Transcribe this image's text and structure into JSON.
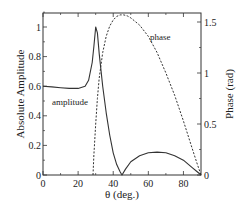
{
  "chart_data": {
    "type": "line",
    "title": "",
    "xlabel": "θ (deg.)",
    "ylabel": "Absolute Amplitude",
    "y2label": "Phase (rad)",
    "xlim": [
      0,
      90
    ],
    "ylim": [
      0,
      1.1
    ],
    "y2lim": [
      0,
      1.6
    ],
    "grid": false,
    "x_ticks": [
      0,
      20,
      40,
      60,
      80
    ],
    "y_ticks": [
      0,
      0.2,
      0.4,
      0.6,
      0.8,
      1
    ],
    "y2_ticks": [
      0,
      0.5,
      1,
      1.5
    ],
    "x_tick_labels": [
      "0",
      "20",
      "40",
      "60",
      "80"
    ],
    "y_tick_labels": [
      "0",
      "0.2",
      "0.4",
      "0.6",
      "0.8",
      "1"
    ],
    "y2_tick_labels": [
      "0",
      "0.5",
      "1",
      "1.5"
    ],
    "series": [
      {
        "name": "amplitude",
        "axis": "left",
        "style": "solid",
        "x": [
          0,
          5,
          10,
          15,
          20,
          24,
          26,
          28,
          29,
          30,
          31,
          32,
          34,
          36,
          38,
          40,
          42,
          44,
          45,
          47,
          50,
          55,
          60,
          65,
          70,
          75,
          80,
          85,
          88,
          90
        ],
        "y": [
          0.6,
          0.595,
          0.59,
          0.585,
          0.585,
          0.6,
          0.64,
          0.76,
          0.87,
          1.0,
          0.96,
          0.82,
          0.6,
          0.42,
          0.27,
          0.15,
          0.07,
          0.02,
          0.0,
          0.04,
          0.09,
          0.13,
          0.15,
          0.155,
          0.15,
          0.13,
          0.1,
          0.05,
          0.02,
          0.0
        ]
      },
      {
        "name": "phase",
        "axis": "right",
        "style": "dashed",
        "x": [
          28.5,
          29,
          30,
          31,
          32,
          34,
          36,
          38,
          40,
          42,
          44,
          46,
          48,
          50,
          55,
          60,
          65,
          70,
          75,
          80,
          85,
          88,
          90
        ],
        "y": [
          0.0,
          0.2,
          0.5,
          0.75,
          0.95,
          1.2,
          1.36,
          1.46,
          1.52,
          1.555,
          1.57,
          1.57,
          1.56,
          1.54,
          1.47,
          1.36,
          1.2,
          1.0,
          0.78,
          0.53,
          0.26,
          0.1,
          0.0
        ]
      }
    ],
    "annotations": [
      {
        "text": "amplitude",
        "x": 9,
        "y": 0.67,
        "axis": "left"
      },
      {
        "text": "phase",
        "x": 52,
        "y": 1.35,
        "axis": "right"
      }
    ]
  },
  "labels": {
    "xlabel": "θ (deg.)",
    "ylabel": "Absolute Amplitude",
    "y2label": "Phase (rad)",
    "amplitude_annotation": "amplitude",
    "phase_annotation": "phase"
  }
}
